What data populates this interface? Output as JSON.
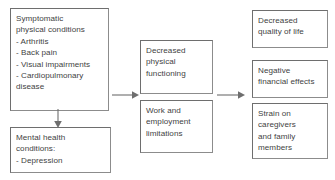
{
  "diagram": {
    "type": "flow-diagram",
    "colors": {
      "box_border": "#8c8c8c",
      "box_border_shadow": "#6e6e6e",
      "text": "#3f3f3f",
      "arrow": "#6e6e6e",
      "background": "#ffffff"
    },
    "nodes": {
      "physical_conditions": {
        "id": "symptomatic-physical-conditions",
        "text": "Symptomatic\nphysical conditions\n- Arthritis\n- Back pain\n- Visual impairments\n- Cardiopulmonary\ndisease",
        "column": "left"
      },
      "mental_health": {
        "id": "mental-health-conditions",
        "text": "Mental health\nconditions:\n- Depression",
        "column": "left"
      },
      "physical_functioning": {
        "id": "decreased-physical-functioning",
        "text": "Decreased\nphysical\nfunctioning",
        "column": "middle"
      },
      "work_limitations": {
        "id": "work-and-employment-limitations",
        "text": "Work and\nemployment\nlimitations",
        "column": "middle"
      },
      "quality_of_life": {
        "id": "decreased-quality-of-life",
        "text": "Decreased\nquality of life",
        "column": "right"
      },
      "financial_effects": {
        "id": "negative-financial-effects",
        "text": "Negative\nfinancial effects",
        "column": "right"
      },
      "caregiver_strain": {
        "id": "strain-on-caregivers",
        "text": "Strain on\ncaregivers\nand family\nmembers",
        "column": "right"
      }
    },
    "edges": [
      {
        "id": "conditions-to-functioning",
        "from": "physical_conditions",
        "to": "physical_functioning",
        "direction": "right",
        "label": ""
      },
      {
        "id": "physical-to-mental",
        "from": "physical_conditions",
        "to": "mental_health",
        "direction": "down",
        "label": ""
      },
      {
        "id": "middle-to-outcomes",
        "from": "physical_functioning",
        "to": "quality_of_life",
        "direction": "right",
        "label": ""
      }
    ]
  }
}
